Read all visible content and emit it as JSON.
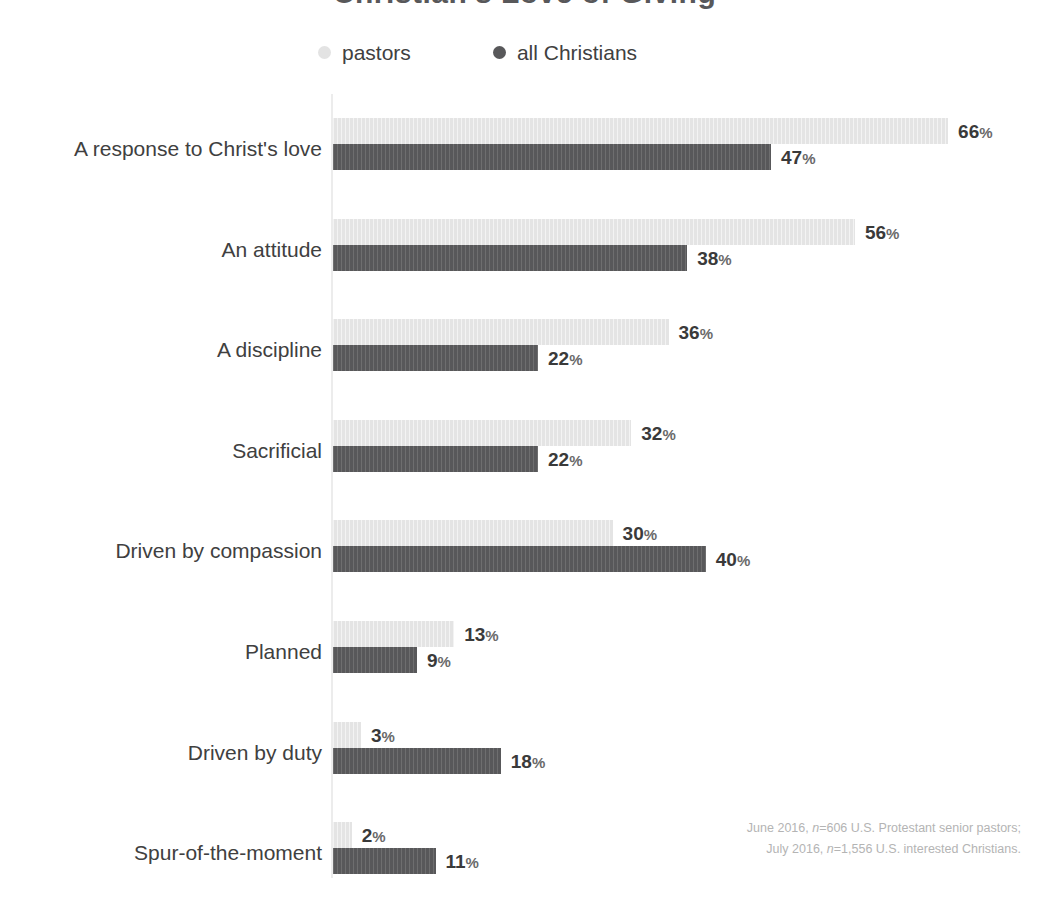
{
  "title": "Christian's Love of Giving",
  "legend": {
    "items": [
      {
        "label": "pastors",
        "color": "#e3e3e3",
        "key": "pastors"
      },
      {
        "label": "all Christians",
        "color": "#58585a",
        "key": "christians"
      }
    ]
  },
  "footnote": {
    "line1_pre": "June 2016, ",
    "line1_n": "n",
    "line1_post": "=606 U.S. Protestant senior pastors;",
    "line2_pre": "July 2016, ",
    "line2_n": "n",
    "line2_post": "=1,556 U.S. interested Christians."
  },
  "colors": {
    "pastors": "#e3e3e3",
    "christians": "#58585a",
    "axis": "#ececec",
    "label_text": "#404040",
    "value_text": "#3a3a3a",
    "footnote_text": "#b4b4b4",
    "background": "#ffffff"
  },
  "chart_data": {
    "type": "bar",
    "orientation": "horizontal",
    "title": "Christian's Love of Giving",
    "xlabel": "",
    "ylabel": "",
    "xlim": [
      0,
      70
    ],
    "grid": false,
    "legend_position": "top",
    "value_suffix": "%",
    "categories": [
      "A response to Christ's love",
      "An attitude",
      "A discipline",
      "Sacrificial",
      "Driven by compassion",
      "Planned",
      "Driven by duty",
      "Spur-of-the-moment"
    ],
    "series": [
      {
        "name": "pastors",
        "color": "#e3e3e3",
        "values": [
          66,
          56,
          36,
          32,
          30,
          13,
          3,
          2
        ]
      },
      {
        "name": "all Christians",
        "color": "#58585a",
        "values": [
          47,
          38,
          22,
          22,
          40,
          9,
          18,
          11
        ]
      }
    ],
    "value_labels": {
      "pastors": [
        "66%",
        "56%",
        "36%",
        "32%",
        "30%",
        "13%",
        "3%",
        "2%"
      ],
      "all Christians": [
        "47%",
        "38%",
        "22%",
        "22%",
        "40%",
        "9%",
        "18%",
        "11%"
      ]
    }
  }
}
